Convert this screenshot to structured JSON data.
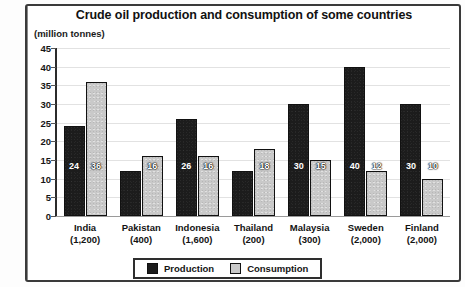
{
  "chart_data": {
    "type": "bar",
    "title": "Crude oil production and consumption of some countries",
    "unit_label": "(million tonnes)",
    "xlabel": "",
    "ylabel": "",
    "ylim": [
      0,
      45
    ],
    "yticks": [
      45,
      40,
      35,
      30,
      25,
      20,
      15,
      10,
      5,
      0
    ],
    "grid": true,
    "legend_position": "bottom",
    "categories": [
      "India",
      "Pakistan",
      "Indonesia",
      "Thailand",
      "Malaysia",
      "Sweden",
      "Finland"
    ],
    "category_sublabels": [
      "(1,200)",
      "(400)",
      "(1,600)",
      "(200)",
      "(300)",
      "(2,000)",
      "(2,000)"
    ],
    "series": [
      {
        "name": "Production",
        "color": "#1c1c1c",
        "values": [
          24,
          12,
          26,
          12,
          30,
          40,
          30
        ]
      },
      {
        "name": "Consumption",
        "color": "#c9c9c9",
        "values": [
          36,
          16,
          16,
          18,
          15,
          12,
          10
        ]
      }
    ]
  }
}
